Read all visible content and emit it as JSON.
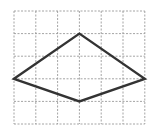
{
  "grid": {
    "columns": 6,
    "rows": 5,
    "origin_x": 14,
    "origin_y": 11,
    "cell_w": 21.8,
    "cell_h": 22.6,
    "line_color": "#9a9a9a",
    "dash": "2,1.5"
  },
  "shape": {
    "type": "quadrilateral",
    "vertices_grid": [
      [
        0,
        3
      ],
      [
        3,
        1
      ],
      [
        6,
        3
      ],
      [
        3,
        4
      ]
    ],
    "stroke_color": "#333333",
    "stroke_width": 2.4
  }
}
